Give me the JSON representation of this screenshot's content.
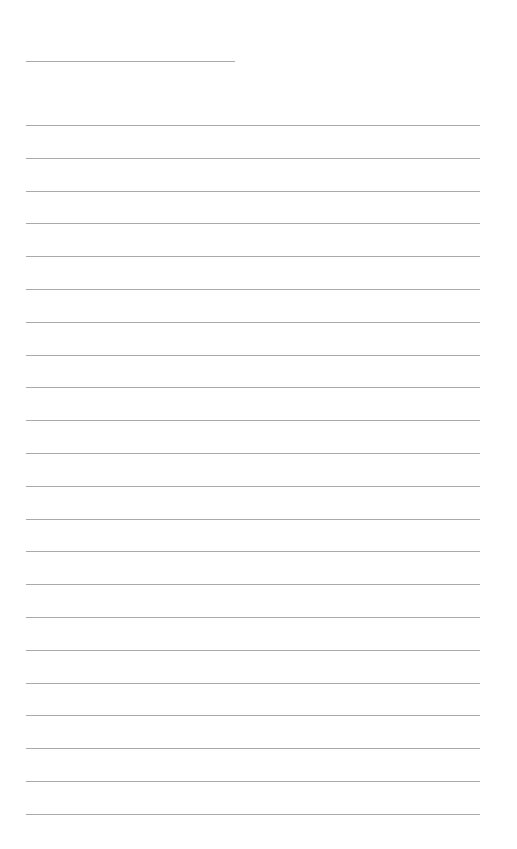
{
  "page": {
    "type": "lined-writing-sheet",
    "background": "#ffffff",
    "line_color": "#9a9a9a",
    "title_line": {
      "x": 26,
      "y": 61,
      "width": 209
    },
    "ruled_lines": {
      "x": 26,
      "width": 454,
      "start_y": 125,
      "spacing": 32.8,
      "count": 22
    }
  }
}
